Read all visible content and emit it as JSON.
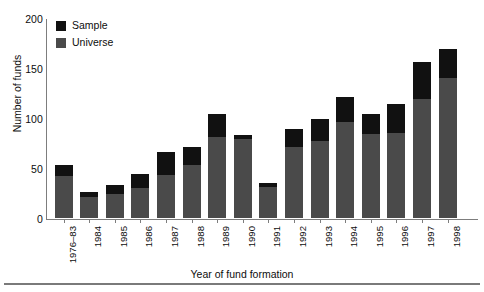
{
  "chart_data": {
    "type": "bar",
    "stacked": true,
    "title": "",
    "xlabel": "Year of fund formation",
    "ylabel": "Number of funds",
    "ylim": [
      0,
      200
    ],
    "yticks": [
      0,
      50,
      100,
      150,
      200
    ],
    "grid": false,
    "legend_position": "top-left",
    "categories": [
      "1976–83",
      "1984",
      "1985",
      "1986",
      "1987",
      "1988",
      "1989",
      "1990",
      "1991",
      "1992",
      "1993",
      "1994",
      "1995",
      "1996",
      "1997",
      "1998"
    ],
    "series": [
      {
        "name": "Universe",
        "color": "#4a4a4a",
        "values": [
          43,
          22,
          25,
          31,
          44,
          54,
          82,
          80,
          32,
          72,
          78,
          97,
          85,
          86,
          120,
          141
        ]
      },
      {
        "name": "Sample",
        "color": "#111111",
        "values": [
          11,
          5,
          9,
          14,
          23,
          18,
          23,
          4,
          4,
          18,
          22,
          25,
          20,
          29,
          37,
          29
        ]
      }
    ],
    "totals": [
      54,
      27,
      34,
      45,
      67,
      72,
      105,
      84,
      36,
      90,
      100,
      122,
      105,
      115,
      157,
      170
    ]
  },
  "legend": {
    "entries": [
      {
        "label": "Sample",
        "color": "#111111"
      },
      {
        "label": "Universe",
        "color": "#4a4a4a"
      }
    ]
  },
  "axes": {
    "y_title": "Number of funds",
    "x_title": "Year of fund formation",
    "y_tick_labels": [
      "200",
      "150",
      "100",
      "50",
      "0"
    ]
  }
}
